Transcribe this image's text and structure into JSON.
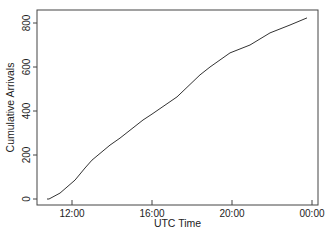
{
  "chart_data": {
    "type": "line",
    "title": "",
    "xlabel": "UTC Time",
    "ylabel": "Cumulative Arrivals",
    "x_unit": "hours (UTC, 24 = 00:00 next day)",
    "xlim": [
      10.25,
      24.3
    ],
    "ylim": [
      -25,
      860
    ],
    "x_ticks": [
      {
        "value": 12,
        "label": "12:00"
      },
      {
        "value": 16,
        "label": "16:00"
      },
      {
        "value": 20,
        "label": "20:00"
      },
      {
        "value": 24,
        "label": "00:00"
      }
    ],
    "y_ticks": [
      {
        "value": 0,
        "label": "0"
      },
      {
        "value": 200,
        "label": "200"
      },
      {
        "value": 400,
        "label": "400"
      },
      {
        "value": 600,
        "label": "600"
      },
      {
        "value": 800,
        "label": "800"
      }
    ],
    "grid": false,
    "legend": null,
    "series": [
      {
        "name": "Cumulative Arrivals",
        "color": "#333333",
        "x": [
          10.75,
          10.85,
          11.4,
          12.15,
          12.65,
          13.0,
          13.9,
          14.4,
          15.55,
          16.0,
          17.25,
          18.4,
          18.9,
          19.9,
          20.9,
          21.9,
          22.9,
          23.75
        ],
        "y": [
          0,
          0,
          27,
          86,
          141,
          177,
          245,
          277,
          359,
          386,
          464,
          564,
          600,
          664,
          700,
          755,
          791,
          823
        ]
      }
    ]
  },
  "layout": {
    "plot_box": {
      "left": 37,
      "top": 10,
      "right": 318,
      "bottom": 205
    },
    "x_px": {
      "ref_value": 12,
      "ref_px": 72,
      "px_per_unit": 20
    },
    "y_px": {
      "ref_value": 0,
      "ref_px": 199,
      "px_per_unit": 0.22
    }
  }
}
